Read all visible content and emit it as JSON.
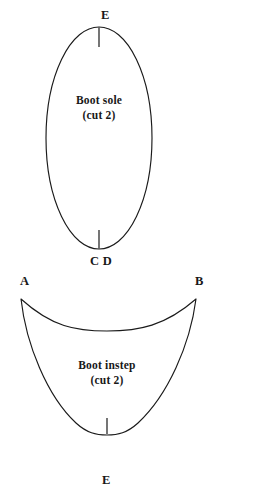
{
  "page": {
    "background_color": "#ffffff",
    "ink_color": "#1a1a1a"
  },
  "pieces": [
    {
      "id": "boot-sole",
      "name": "Boot sole",
      "caption_title": "Boot sole",
      "caption_quantity": "(cut 2)",
      "shape": "ellipse",
      "markers": [
        {
          "label": "E",
          "position": "top"
        },
        {
          "label": "C D",
          "position": "bottom"
        }
      ]
    },
    {
      "id": "boot-instep",
      "name": "Boot instep",
      "caption_title": "Boot instep",
      "caption_quantity": "(cut 2)",
      "shape": "shield",
      "markers": [
        {
          "label": "A",
          "position": "top-left"
        },
        {
          "label": "B",
          "position": "top-right"
        },
        {
          "label": "E",
          "position": "bottom"
        }
      ]
    }
  ]
}
